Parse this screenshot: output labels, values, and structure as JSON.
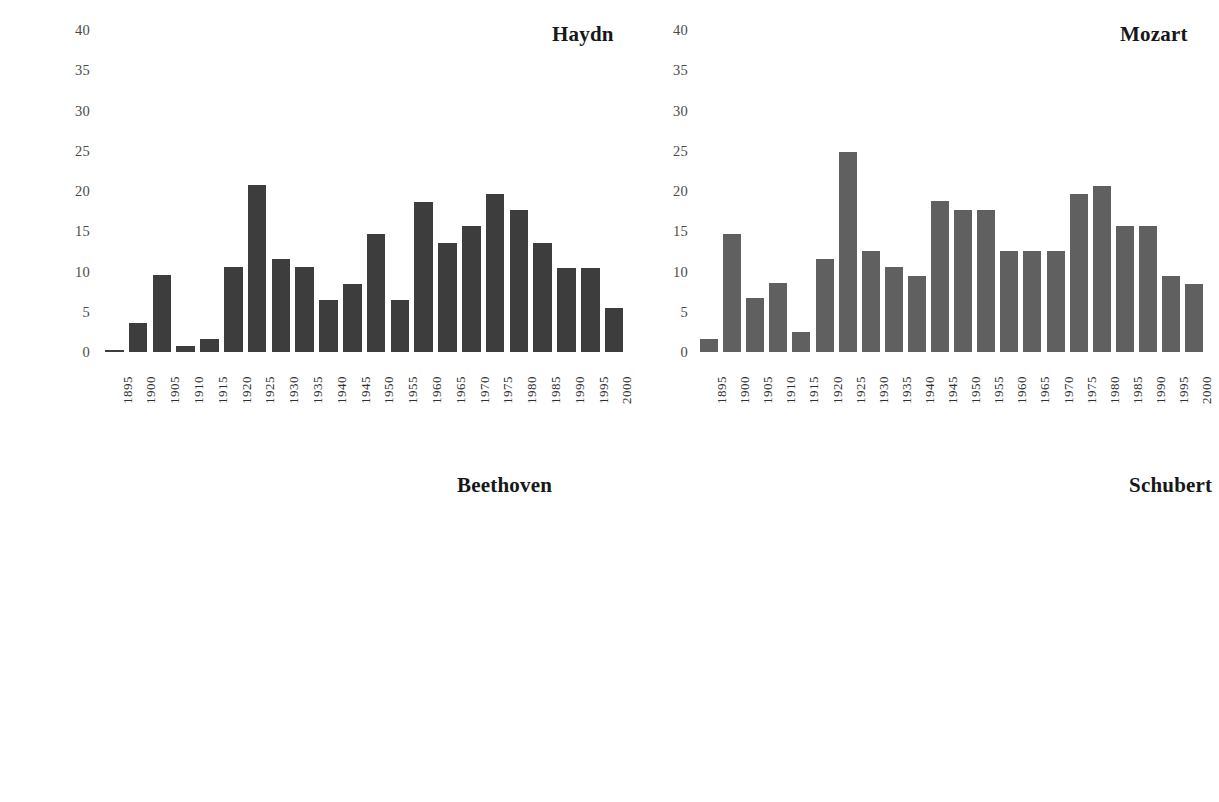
{
  "figure": {
    "background": "#ffffff",
    "layout": "2x2-grid-of-bar-charts",
    "note_cropped": "bottom row panels are cut off by the image edge"
  },
  "chart_data": [
    {
      "id": "haydn",
      "type": "bar",
      "title": "Haydn",
      "xlabel": "",
      "ylabel": "",
      "grid": false,
      "legend": null,
      "bar_color": "#3d3d3d",
      "ylim": [
        0,
        40
      ],
      "yticks": [
        0,
        5,
        10,
        15,
        20,
        25,
        30,
        35,
        40
      ],
      "ytick_labels": [
        "0",
        "5",
        "10",
        "15",
        "20",
        "25",
        "30",
        "35",
        "40"
      ],
      "categories": [
        "1895",
        "1900",
        "1905",
        "1910",
        "1915",
        "1920",
        "1925",
        "1930",
        "1935",
        "1940",
        "1945",
        "1950",
        "1955",
        "1960",
        "1965",
        "1970",
        "1975",
        "1980",
        "1985",
        "1990",
        "1995",
        "2000"
      ],
      "values": [
        0.2,
        3.6,
        9.6,
        0.7,
        1.6,
        10.6,
        20.7,
        11.6,
        10.5,
        6.5,
        8.5,
        14.7,
        6.5,
        18.6,
        13.6,
        15.6,
        19.6,
        17.6,
        13.5,
        10.4,
        10.4,
        5.5
      ]
    },
    {
      "id": "mozart",
      "type": "bar",
      "title": "Mozart",
      "xlabel": "",
      "ylabel": "",
      "grid": false,
      "legend": null,
      "bar_color": "#606060",
      "ylim": [
        0,
        40
      ],
      "yticks": [
        0,
        5,
        10,
        15,
        20,
        25,
        30,
        35,
        40
      ],
      "ytick_labels": [
        "0",
        "5",
        "10",
        "15",
        "20",
        "25",
        "30",
        "35",
        "40"
      ],
      "categories": [
        "1895",
        "1900",
        "1905",
        "1910",
        "1915",
        "1920",
        "1925",
        "1930",
        "1935",
        "1940",
        "1945",
        "1950",
        "1955",
        "1960",
        "1965",
        "1970",
        "1975",
        "1980",
        "1985",
        "1990",
        "1995",
        "2000"
      ],
      "values": [
        1.6,
        14.7,
        6.7,
        8.6,
        2.5,
        11.6,
        24.9,
        12.6,
        10.5,
        9.4,
        18.7,
        17.7,
        17.7,
        12.6,
        12.6,
        12.6,
        19.6,
        20.6,
        15.6,
        15.6,
        9.4,
        8.5
      ]
    },
    {
      "id": "beethoven",
      "type": "bar",
      "title": "Beethoven",
      "xlabel": "",
      "ylabel": "",
      "grid": false,
      "legend": null,
      "bar_color": "#dcdcdc",
      "ylim": [
        0,
        57
      ],
      "yticks": [
        20,
        25,
        30,
        35,
        40,
        45,
        50,
        55
      ],
      "ytick_labels": [
        "20",
        "25",
        "30",
        "35",
        "40",
        "45",
        "50",
        "55"
      ],
      "categories": [
        "1895",
        "1900",
        "1905",
        "1910",
        "1915",
        "1920",
        "1925",
        "1930",
        "1935",
        "1940",
        "1945",
        "1950",
        "1955",
        "1960",
        "1965",
        "1970",
        "1975",
        "1980",
        "1985",
        "1990",
        "1995",
        "2000"
      ],
      "values": [
        21.0,
        47.6,
        43.8,
        52.7,
        44.7,
        46.7,
        41.5,
        46.7,
        42.6,
        54.7,
        49.6,
        45.5,
        47.6,
        46.6,
        39.5,
        34.4,
        29.2,
        28.1,
        18.7,
        30.2,
        20.0,
        0
      ],
      "note": "panel is cropped by the bottom edge of the image; x tick labels not visible"
    },
    {
      "id": "schubert",
      "type": "bar",
      "title": "Schubert",
      "xlabel": "",
      "ylabel": "",
      "grid": false,
      "legend": null,
      "bar_color": "#6e6e6e",
      "ylim": [
        0,
        57
      ],
      "yticks": [
        20,
        25,
        30,
        35,
        40,
        45,
        50,
        55
      ],
      "ytick_labels": [
        "20",
        "25",
        "30",
        "35",
        "40",
        "45",
        "50",
        "55"
      ],
      "categories": [
        "1895",
        "1900",
        "1905",
        "1910",
        "1915",
        "1920",
        "1925",
        "1930",
        "1935",
        "1940",
        "1945",
        "1950",
        "1955",
        "1960",
        "1965",
        "1970",
        "1975",
        "1980",
        "1985",
        "1990",
        "1995",
        "2000"
      ],
      "values": [
        0,
        0,
        0,
        0,
        0,
        0,
        0,
        0,
        0,
        0,
        0,
        0,
        0,
        0,
        0,
        0,
        0,
        18.5,
        0,
        0,
        0,
        0
      ],
      "note": "panel is cropped by the bottom edge of the image; only one partially visible bar near 1980"
    }
  ]
}
